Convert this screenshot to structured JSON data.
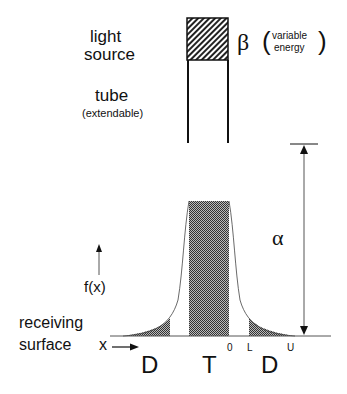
{
  "labels": {
    "light_source_1": "light",
    "light_source_2": "source",
    "beta_symbol": "β",
    "beta_open": "(",
    "beta_close": ")",
    "beta_note_1": "variable",
    "beta_note_2": "energy",
    "tube": "tube",
    "tube_note": "(extendable)",
    "alpha_symbol": "α",
    "fx": "f(x)",
    "surface_1": "receiving",
    "surface_2": "surface",
    "x_axis": "x",
    "region_d_left": "D",
    "region_t": "T",
    "region_d_right": "D",
    "mark_0": "0",
    "mark_l": "L",
    "mark_u": "U"
  },
  "colors": {
    "ink": "#111111",
    "shade": "#555555",
    "curve": "#444444"
  }
}
